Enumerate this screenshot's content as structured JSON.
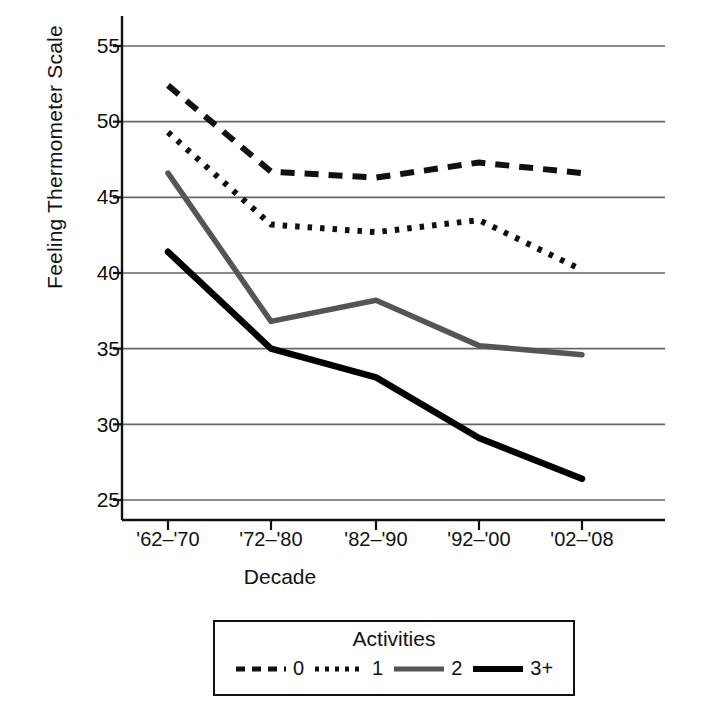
{
  "chart_data": {
    "type": "line",
    "title": "",
    "xlabel": "Decade",
    "ylabel": "Feeling Thermometer Scale",
    "categories": [
      "'62–'70",
      "'72–'80",
      "'82–'90",
      "'92–'00",
      "'02–'08"
    ],
    "ylim": [
      22.5,
      56.5
    ],
    "yticks": [
      25,
      30,
      35,
      40,
      45,
      50,
      55
    ],
    "grid": "horizontal",
    "legend_title": "Activities",
    "legend_position": "bottom-outside",
    "series": [
      {
        "name": "0",
        "style": "dashed",
        "color": "#111111",
        "values": [
          52.4,
          46.7,
          46.3,
          47.3,
          46.6
        ]
      },
      {
        "name": "1",
        "style": "dotted",
        "color": "#111111",
        "values": [
          49.3,
          43.2,
          42.7,
          43.5,
          40.2
        ]
      },
      {
        "name": "2",
        "style": "solid",
        "color": "#555555",
        "values": [
          46.6,
          36.8,
          38.2,
          35.2,
          34.6
        ]
      },
      {
        "name": "3+",
        "style": "solid",
        "color": "#000000",
        "values": [
          41.4,
          35.0,
          33.1,
          29.1,
          26.4
        ]
      }
    ]
  },
  "axis": {
    "ytick_labels": [
      "55",
      "50",
      "45",
      "40",
      "35",
      "30",
      "25"
    ],
    "xtick_labels": [
      "'62–'70",
      "'72–'80",
      "'82–'90",
      "'92–'00",
      "'02–'08"
    ],
    "y_axis_title": "Feeling Thermometer Scale",
    "x_axis_title": "Decade"
  },
  "legend": {
    "title": "Activities",
    "items": [
      {
        "label": "0",
        "key": "dashed-line-key"
      },
      {
        "label": "1",
        "key": "dotted-line-key"
      },
      {
        "label": "2",
        "key": "gray-solid-line-key"
      },
      {
        "label": "3+",
        "key": "black-solid-line-key"
      }
    ]
  },
  "colors": {
    "axis": "#111111",
    "grid": "#666666",
    "series_gray": "#555555",
    "series_black": "#000000",
    "background": "#ffffff"
  }
}
